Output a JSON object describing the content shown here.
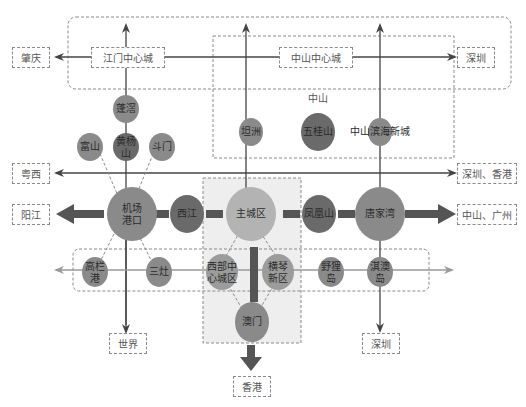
{
  "colors": {
    "node_light": "#9c9c9c",
    "node_mid": "#8a8a8a",
    "node_dark": "#6a6a6a",
    "node_main": "#b3b3b3",
    "arrow_thick": "#555555",
    "arrow_thin": "#555555",
    "arrow_light": "#a0a0a0",
    "zone_fill": "#eeeeee",
    "dash": "#8a8a8a"
  },
  "destinations": {
    "zhaoqing": "肇庆",
    "shenzhen_top": "深圳",
    "yuexi": "粤西",
    "shenzhen_hk": "深圳、香港",
    "yangjiang": "阳江",
    "zhongshan_guangzhou": "中山、广州",
    "world": "世界",
    "shenzhen_bottom": "深圳",
    "hongkong": "香港"
  },
  "centers": {
    "jiangmen": "江门中心城",
    "zhongshan": "中山中心城"
  },
  "zhongshan_group_label": "中山",
  "nodes": {
    "lianxi": "蓬滘",
    "fushan": "富山",
    "huangyangshan": "黄杨山",
    "doumen": "斗门",
    "tanzhou": "坦洲",
    "wuguishan": "五桂山",
    "zhongshan_binhai": "中山滨海新城",
    "airport_port": "机场港口",
    "xijiang": "西江",
    "main_city": "主城区",
    "fenghuangshan": "凤凰山",
    "tangjiawan": "唐家湾",
    "gaolangang": "高栏港",
    "sanzao": "三灶",
    "west_center": "西部中心城区",
    "hengqin": "横琴新区",
    "yeli_island": "野狸岛",
    "qiao_island": "淇澳岛",
    "macau": "澳门"
  }
}
